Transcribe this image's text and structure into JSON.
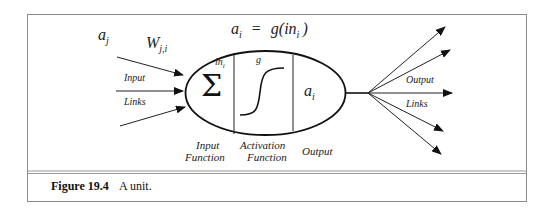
{
  "figure": {
    "number_label": "Figure 19.4",
    "caption": "A unit."
  },
  "diagram": {
    "formula": {
      "lhs": "a",
      "lhs_sub": "i",
      "equals": "=",
      "rhs_func": "g(in",
      "rhs_sub": "i",
      "rhs_close": ")"
    },
    "input_activation": {
      "base": "a",
      "sub": "j"
    },
    "weight": {
      "base": "W",
      "sub": "j,i"
    },
    "input_links_label_line1": "Input",
    "input_links_label_line2": "Links",
    "output_links_label_line1": "Output",
    "output_links_label_line2": "Links",
    "unit": {
      "sum_symbol": "Σ",
      "in_label": {
        "base": "in",
        "sub": "i"
      },
      "g_label": "g",
      "output_value": {
        "base": "a",
        "sub": "i"
      }
    },
    "section_labels": {
      "input_function_line1": "Input",
      "input_function_line2": "Function",
      "activation_function_line1": "Activation",
      "activation_function_line2": "Function",
      "output": "Output"
    },
    "input_arrow_count": 3,
    "output_arrow_count": 6
  }
}
